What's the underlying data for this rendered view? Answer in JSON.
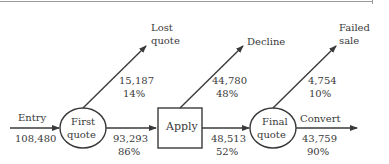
{
  "diagram": {
    "type": "flow",
    "nodes": [
      {
        "id": "first_quote",
        "label_line1": "First",
        "label_line2": "quote",
        "shape": "ellipse"
      },
      {
        "id": "apply",
        "label": "Apply",
        "shape": "box"
      },
      {
        "id": "final_quote",
        "label_line1": "Final",
        "label_line2": "quote",
        "shape": "ellipse"
      }
    ],
    "entry": {
      "label": "Entry",
      "value": "108,480"
    },
    "lost_quote": {
      "label_line1": "Lost",
      "label_line2": "quote",
      "value": "15,187",
      "pct": "14%"
    },
    "to_apply": {
      "value": "93,293",
      "pct": "86%"
    },
    "decline": {
      "label": "Decline",
      "value": "44,780",
      "pct": "48%"
    },
    "to_final": {
      "value": "48,513",
      "pct": "52%"
    },
    "failed_sale": {
      "label_line1": "Failed",
      "label_line2": "sale",
      "value": "4,754",
      "pct": "10%"
    },
    "convert": {
      "label": "Convert",
      "value": "43,759",
      "pct": "90%"
    },
    "colors": {
      "stroke": "#3a3a3a",
      "text": "#3a3a3a"
    }
  }
}
